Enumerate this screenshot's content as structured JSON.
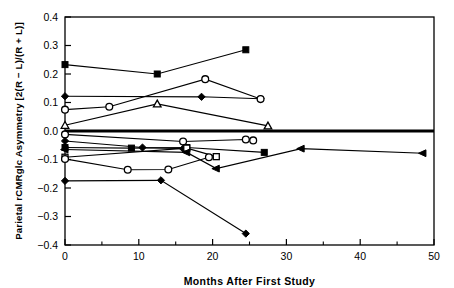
{
  "figure": {
    "background": "#ffffff",
    "foreground": "#000000",
    "line_color": "#000000"
  },
  "chart_data": {
    "type": "line",
    "title": "",
    "subtitle": "",
    "xlabel": "Months After First Study",
    "ylabel": "Parietal rCMRglc Asymmetry [2(R − L)/(R + L)]",
    "xlim": [
      0,
      50
    ],
    "ylim": [
      -0.4,
      0.4
    ],
    "xticks": [
      0,
      10,
      20,
      30,
      40,
      50
    ],
    "xtick_labels": [
      "0",
      "10",
      "20",
      "30",
      "40",
      "50"
    ],
    "xminorticks": [
      5,
      15,
      25,
      35,
      45
    ],
    "yticks": [
      -0.4,
      -0.3,
      -0.2,
      -0.1,
      0.0,
      0.1,
      0.2,
      0.3,
      0.4
    ],
    "ytick_labels": [
      "−0.4",
      "−0.3",
      "−0.2",
      "−0.1",
      "0.0",
      "0.1",
      "0.2",
      "0.3",
      "0.4"
    ],
    "grid": false,
    "legend": false,
    "legend_position": "none",
    "zero_reference_line": {
      "y": 0.0,
      "emphasis": "bold",
      "width_px": 3
    },
    "markers_used": [
      "filled-square",
      "open-square",
      "filled-diamond",
      "open-circle",
      "open-triangle",
      "filled-triangle-left"
    ],
    "series": [
      {
        "name": "subject-1",
        "marker": "filled-square",
        "x": [
          0,
          12.5,
          24.5
        ],
        "values": [
          0.233,
          0.2,
          0.285
        ]
      },
      {
        "name": "subject-2",
        "marker": "filled-diamond",
        "x": [
          0,
          18.5,
          26.5
        ],
        "values": [
          0.122,
          0.12,
          0.113
        ]
      },
      {
        "name": "subject-3",
        "marker": "open-circle",
        "x": [
          0,
          6.0,
          19.0,
          26.5
        ],
        "values": [
          0.075,
          0.085,
          0.182,
          0.112
        ]
      },
      {
        "name": "subject-4",
        "marker": "open-triangle",
        "x": [
          0,
          12.5,
          27.5
        ],
        "values": [
          0.02,
          0.095,
          0.018
        ]
      },
      {
        "name": "subject-5",
        "marker": "open-circle",
        "x": [
          0,
          16.0,
          24.5,
          25.5
        ],
        "values": [
          -0.012,
          -0.037,
          -0.03,
          -0.033
        ]
      },
      {
        "name": "subject-6",
        "marker": "filled-diamond",
        "x": [
          0,
          10.5,
          16.0
        ],
        "values": [
          -0.035,
          -0.058,
          -0.062
        ]
      },
      {
        "name": "subject-7",
        "marker": "filled-square",
        "x": [
          0,
          9.0,
          16.5,
          27.0
        ],
        "values": [
          -0.058,
          -0.06,
          -0.058,
          -0.075
        ]
      },
      {
        "name": "subject-8",
        "marker": "open-square",
        "x": [
          0,
          16.5,
          20.5
        ],
        "values": [
          -0.092,
          -0.06,
          -0.09
        ]
      },
      {
        "name": "subject-9",
        "marker": "open-circle",
        "x": [
          0,
          8.5,
          14.0,
          19.5
        ],
        "values": [
          -0.098,
          -0.136,
          -0.135,
          -0.092
        ]
      },
      {
        "name": "subject-10",
        "marker": "filled-triangle-left",
        "x": [
          0,
          16.5,
          20.5,
          32.0,
          48.5
        ],
        "values": [
          -0.065,
          -0.075,
          -0.132,
          -0.062,
          -0.078
        ]
      },
      {
        "name": "subject-11",
        "marker": "filled-diamond",
        "x": [
          0,
          13.0,
          24.5
        ],
        "values": [
          -0.175,
          -0.173,
          -0.36
        ]
      }
    ]
  }
}
